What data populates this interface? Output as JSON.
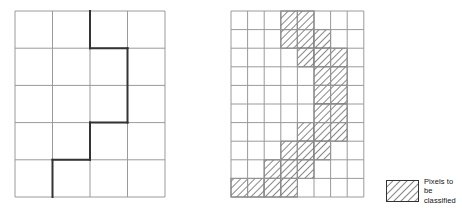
{
  "figure": {
    "name": "pixel-classification-diagram",
    "background_color": "#ffffff"
  },
  "left_panel": {
    "name": "coarse-grid-with-region-boundary",
    "cols": 4,
    "rows": 5,
    "cell_width": 37.5,
    "cell_height": 37.2,
    "grid_line_color": "#9a9a9a",
    "grid_line_width": 1,
    "boundary_color": "#333333",
    "boundary_width": 2,
    "boundary_path": "M 75,0 L 75,37.2 L 112.5,37.2 L 112.5,148.8 L 75,148.8 L 75,186",
    "boundary_segments": [
      {
        "x1": 75,
        "y1": 0,
        "x2": 75,
        "y2": 37.2
      },
      {
        "x1": 75,
        "y1": 37.2,
        "x2": 112.5,
        "y2": 37.2
      },
      {
        "x1": 112.5,
        "y1": 37.2,
        "x2": 112.5,
        "y2": 111.6
      },
      {
        "x1": 112.5,
        "y1": 111.6,
        "x2": 75,
        "y2": 111.6
      },
      {
        "x1": 75,
        "y1": 111.6,
        "x2": 75,
        "y2": 148.8
      },
      {
        "x1": 75,
        "y1": 148.8,
        "x2": 37.5,
        "y2": 148.8
      },
      {
        "x1": 37.5,
        "y1": 148.8,
        "x2": 37.5,
        "y2": 186
      }
    ]
  },
  "right_panel": {
    "name": "fine-grid-with-hatched-pixels",
    "cols": 8,
    "rows": 10,
    "cell_width": 16.6,
    "cell_height": 18.6,
    "grid_line_color": "#9a9a9a",
    "grid_line_width": 1,
    "hatch_color": "#555555",
    "hatch_fill": "#ffffff",
    "hatched_cells": [
      {
        "col": 3,
        "row": 0
      },
      {
        "col": 4,
        "row": 0
      },
      {
        "col": 3,
        "row": 1
      },
      {
        "col": 4,
        "row": 1
      },
      {
        "col": 5,
        "row": 1
      },
      {
        "col": 4,
        "row": 2
      },
      {
        "col": 5,
        "row": 2
      },
      {
        "col": 6,
        "row": 2
      },
      {
        "col": 5,
        "row": 3
      },
      {
        "col": 6,
        "row": 3
      },
      {
        "col": 5,
        "row": 4
      },
      {
        "col": 6,
        "row": 4
      },
      {
        "col": 5,
        "row": 5
      },
      {
        "col": 6,
        "row": 5
      },
      {
        "col": 4,
        "row": 6
      },
      {
        "col": 5,
        "row": 6
      },
      {
        "col": 6,
        "row": 6
      },
      {
        "col": 3,
        "row": 7
      },
      {
        "col": 4,
        "row": 7
      },
      {
        "col": 5,
        "row": 7
      },
      {
        "col": 2,
        "row": 8
      },
      {
        "col": 3,
        "row": 8
      },
      {
        "col": 4,
        "row": 8
      },
      {
        "col": 0,
        "row": 9
      },
      {
        "col": 1,
        "row": 9
      },
      {
        "col": 2,
        "row": 9
      },
      {
        "col": 3,
        "row": 9
      }
    ]
  },
  "legend": {
    "name": "legend",
    "swatch_name": "hatched-swatch",
    "label": "Pixels to be\nclassified"
  }
}
